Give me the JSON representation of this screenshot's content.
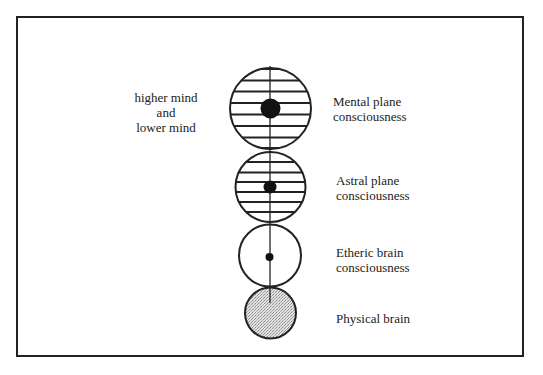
{
  "diagram": {
    "type": "consciousness levels",
    "left_annotation": {
      "lines": [
        "higher mind",
        "and",
        "lower mind"
      ]
    },
    "levels": [
      {
        "id": "mental",
        "label_lines": [
          "Mental plane",
          "consciousness"
        ],
        "style": "hatched",
        "core": "large-dot"
      },
      {
        "id": "astral",
        "label_lines": [
          "Astral plane",
          "consciousness"
        ],
        "style": "hatched",
        "core": "medium-dot"
      },
      {
        "id": "etheric",
        "label_lines": [
          "Etheric brain",
          "consciousness"
        ],
        "style": "plain",
        "core": "small-dot"
      },
      {
        "id": "physical",
        "label_lines": [
          "Physical brain"
        ],
        "style": "stippled",
        "core": "none"
      }
    ],
    "colors": {
      "ink": "#222222",
      "stipple": "#c8c8c8",
      "background": "#ffffff"
    }
  }
}
